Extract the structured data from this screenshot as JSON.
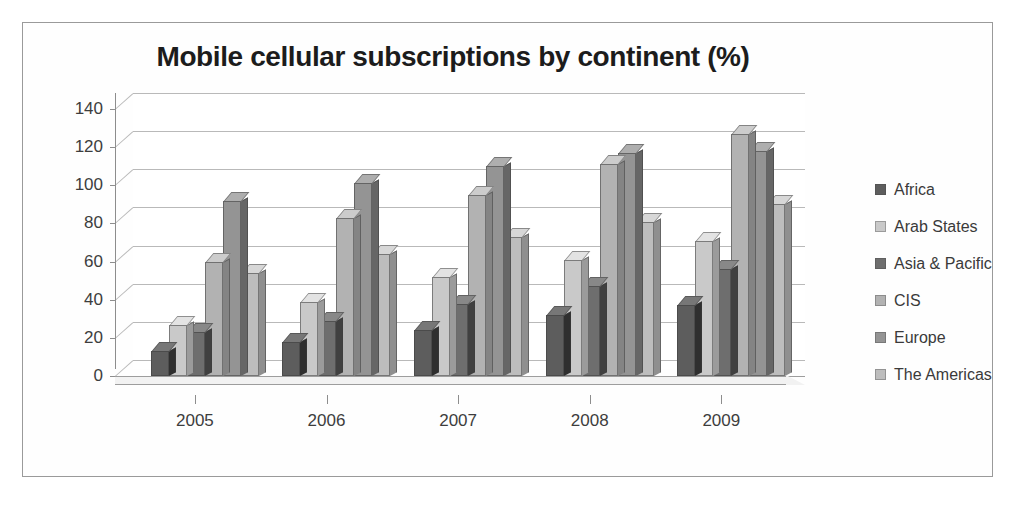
{
  "chart_data": {
    "type": "bar",
    "title": "Mobile cellular subscriptions by continent (%)",
    "xlabel": "",
    "ylabel": "",
    "categories": [
      "2005",
      "2006",
      "2007",
      "2008",
      "2009"
    ],
    "series": [
      {
        "name": "Africa",
        "color": "#5d5d5d",
        "values": [
          13,
          18,
          24,
          32,
          37
        ]
      },
      {
        "name": "Arab States",
        "color": "#c9c9c9",
        "values": [
          27,
          39,
          52,
          61,
          71
        ]
      },
      {
        "name": "Asia & Pacific",
        "color": "#6e6e6e",
        "values": [
          23,
          29,
          38,
          47,
          56
        ]
      },
      {
        "name": "CIS",
        "color": "#b2b2b2",
        "values": [
          60,
          83,
          95,
          111,
          127
        ]
      },
      {
        "name": "Europe",
        "color": "#949494",
        "values": [
          92,
          101,
          110,
          117,
          118
        ]
      },
      {
        "name": "The Americas",
        "color": "#bdbdbd",
        "values": [
          54,
          64,
          73,
          81,
          90
        ]
      }
    ],
    "ylim": [
      0,
      140
    ],
    "yticks": [
      0,
      20,
      40,
      60,
      80,
      100,
      120,
      140
    ],
    "ytick_labels": [
      "0",
      "20",
      "40",
      "60",
      "80",
      "100",
      "120",
      "140"
    ],
    "grid": true,
    "legend_position": "right",
    "three_d": true
  },
  "legend": {
    "items": [
      {
        "label": "Africa",
        "swatch": "#5d5d5d"
      },
      {
        "label": "Arab States",
        "swatch": "#c9c9c9"
      },
      {
        "label": "Asia & Pacific",
        "swatch": "#6e6e6e"
      },
      {
        "label": "CIS",
        "swatch": "#b2b2b2"
      },
      {
        "label": "Europe",
        "swatch": "#949494"
      },
      {
        "label": "The Americas",
        "swatch": "#bdbdbd"
      }
    ]
  },
  "colors": {
    "frame_border": "#9a9a9a",
    "gridline": "#b9b9b9",
    "axis": "#8d8d8d",
    "text": "#3d3d3d",
    "title": "#1c1c1c",
    "background": "#ffffff"
  }
}
